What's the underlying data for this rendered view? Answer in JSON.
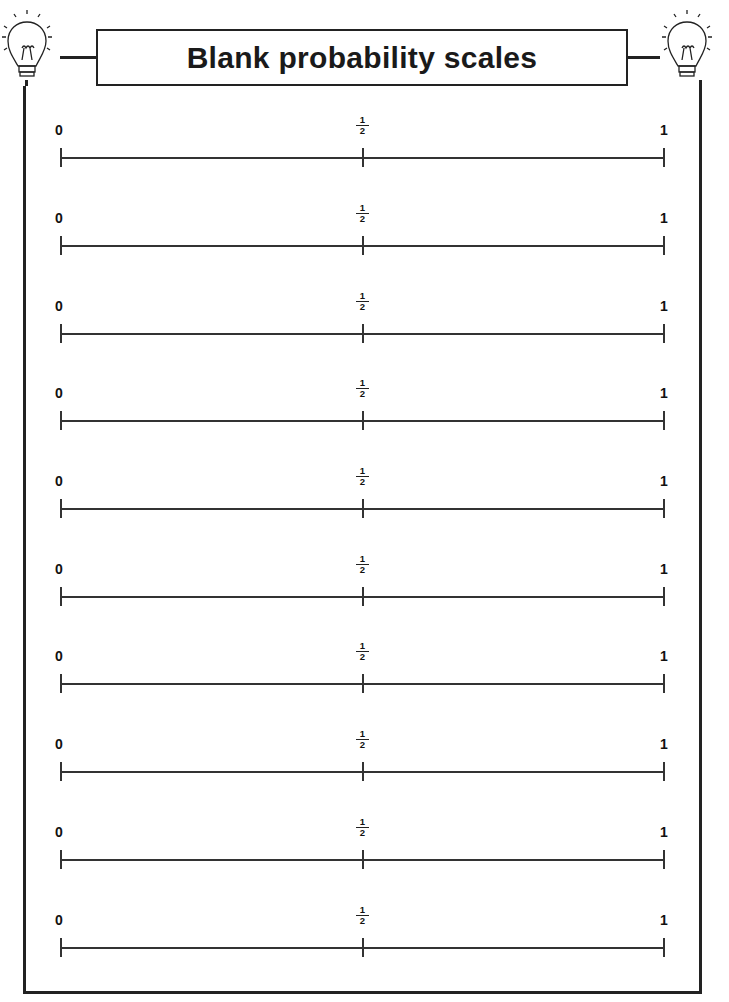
{
  "title": "Blank probability scales",
  "decorations": {
    "left_icon": "lightbulb-icon",
    "right_icon": "lightbulb-icon"
  },
  "scale_labels": {
    "start": "0",
    "mid_numerator": "1",
    "mid_denominator": "2",
    "end": "1"
  },
  "scales": [
    {
      "id": 1
    },
    {
      "id": 2
    },
    {
      "id": 3
    },
    {
      "id": 4
    },
    {
      "id": 5
    },
    {
      "id": 6
    },
    {
      "id": 7
    },
    {
      "id": 8
    },
    {
      "id": 9
    },
    {
      "id": 10
    }
  ],
  "colors": {
    "ink": "#1a1a1a",
    "background": "#ffffff"
  }
}
